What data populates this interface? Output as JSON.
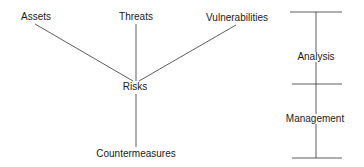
{
  "diagram": {
    "nodes": {
      "assets": "Assets",
      "threats": "Threats",
      "vulnerabilities": "Vulnerabilities",
      "risks": "Risks",
      "countermeasures": "Countermeasures"
    },
    "edges": [
      {
        "from": "Assets",
        "to": "Risks"
      },
      {
        "from": "Threats",
        "to": "Risks"
      },
      {
        "from": "Vulnerabilities",
        "to": "Risks"
      },
      {
        "from": "Risks",
        "to": "Countermeasures"
      }
    ],
    "phases": {
      "analysis": "Analysis",
      "management": "Management"
    },
    "line_color": "#333333"
  }
}
